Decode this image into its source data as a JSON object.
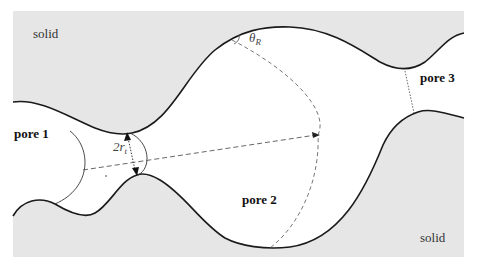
{
  "figure": {
    "type": "pore network schematic",
    "labels": {
      "solid_top": "solid",
      "solid_bottom": "solid",
      "pore1": "pore 1",
      "pore2": "pore 2",
      "pore3": "pore 3",
      "throat_radius_main": "2r",
      "throat_radius_sub": "t",
      "angle_main": "θ",
      "angle_sub": "R"
    },
    "colors": {
      "solid_fill": "#e6e6e6",
      "pore_fill": "#ffffff",
      "wall_stroke": "#1a1a1a",
      "dashed_stroke": "#555555"
    }
  }
}
